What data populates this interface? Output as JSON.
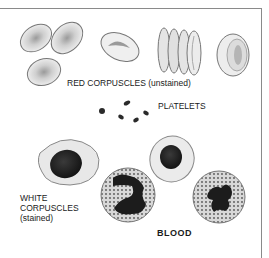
{
  "labels": {
    "red": "RED CORPUSCLES (unstained)",
    "platelets": "PLATELETS",
    "white_line1": "WHITE",
    "white_line2": "CORPUSCLES",
    "white_line3": "(stained)",
    "title": "BLOOD"
  }
}
